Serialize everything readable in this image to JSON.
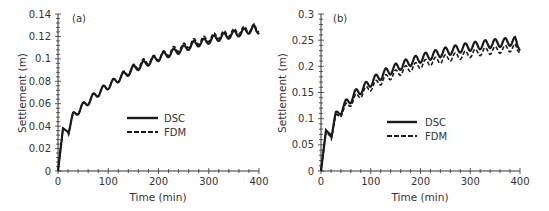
{
  "chart_data": [
    {
      "type": "line",
      "panel_label": "(a)",
      "xlabel": "Time (min)",
      "ylabel": "Settlement (m)",
      "xlim": [
        0,
        400
      ],
      "ylim": [
        0,
        0.14
      ],
      "xticks": [
        "0",
        "100",
        "200",
        "300",
        "400"
      ],
      "yticks": [
        "0",
        "0.02",
        "0.04",
        "0.06",
        "0.08",
        "0.1",
        "0.12",
        "0.14"
      ],
      "grid": false,
      "legend": {
        "position": "center",
        "entries": [
          "DSC",
          "FDM"
        ]
      },
      "oscillation_period_min": 20,
      "series": [
        {
          "name": "DSC",
          "style": "solid",
          "x": [
            0,
            10,
            20,
            30,
            50,
            70,
            90,
            110,
            130,
            150,
            170,
            190,
            210,
            230,
            250,
            270,
            290,
            310,
            330,
            350,
            370,
            390,
            400
          ],
          "y": [
            0,
            0.038,
            0.035,
            0.049,
            0.058,
            0.066,
            0.073,
            0.079,
            0.085,
            0.091,
            0.095,
            0.099,
            0.103,
            0.106,
            0.109,
            0.113,
            0.115,
            0.118,
            0.12,
            0.122,
            0.124,
            0.127,
            0.122
          ],
          "amplitude": 0.003
        },
        {
          "name": "FDM",
          "style": "dashed",
          "x": [
            0,
            10,
            20,
            30,
            50,
            70,
            90,
            110,
            130,
            150,
            170,
            190,
            210,
            230,
            250,
            270,
            290,
            310,
            330,
            350,
            370,
            390,
            400
          ],
          "y": [
            0,
            0.038,
            0.035,
            0.049,
            0.058,
            0.066,
            0.073,
            0.079,
            0.086,
            0.092,
            0.097,
            0.1,
            0.104,
            0.108,
            0.111,
            0.115,
            0.117,
            0.12,
            0.122,
            0.124,
            0.126,
            0.128,
            0.124
          ],
          "amplitude": 0.003
        }
      ]
    },
    {
      "type": "line",
      "panel_label": "(b)",
      "xlabel": "Time (min)",
      "ylabel": "Settlement (m)",
      "xlim": [
        0,
        400
      ],
      "ylim": [
        0,
        0.3
      ],
      "xticks": [
        "0",
        "100",
        "200",
        "300",
        "400"
      ],
      "yticks": [
        "0",
        "0.05",
        "0.1",
        "0.15",
        "0.2",
        "0.25",
        "0.3"
      ],
      "grid": false,
      "legend": {
        "position": "center",
        "entries": [
          "DSC",
          "FDM"
        ]
      },
      "oscillation_period_min": 20,
      "series": [
        {
          "name": "DSC",
          "style": "solid",
          "x": [
            0,
            10,
            20,
            30,
            50,
            70,
            90,
            110,
            130,
            150,
            170,
            190,
            210,
            230,
            250,
            270,
            290,
            310,
            330,
            350,
            370,
            390,
            400
          ],
          "y": [
            0,
            0.078,
            0.068,
            0.105,
            0.128,
            0.148,
            0.162,
            0.176,
            0.188,
            0.197,
            0.205,
            0.212,
            0.218,
            0.223,
            0.228,
            0.232,
            0.236,
            0.239,
            0.242,
            0.244,
            0.246,
            0.248,
            0.23
          ],
          "amplitude": 0.008
        },
        {
          "name": "FDM",
          "style": "dashed",
          "x": [
            0,
            10,
            20,
            30,
            50,
            70,
            90,
            110,
            130,
            150,
            170,
            190,
            210,
            230,
            250,
            270,
            290,
            310,
            330,
            350,
            370,
            390,
            400
          ],
          "y": [
            0,
            0.075,
            0.065,
            0.1,
            0.122,
            0.14,
            0.154,
            0.166,
            0.177,
            0.186,
            0.194,
            0.2,
            0.206,
            0.21,
            0.215,
            0.219,
            0.222,
            0.226,
            0.229,
            0.231,
            0.233,
            0.236,
            0.225
          ],
          "amplitude": 0.007
        }
      ]
    }
  ],
  "panels": [
    {
      "label": "(a)",
      "xlabel": "Time (min)",
      "ylabel": "Settlement (m)",
      "legend": [
        "DSC",
        "FDM"
      ]
    },
    {
      "label": "(b)",
      "xlabel": "Time (min)",
      "ylabel": "Settlement (m)",
      "legend": [
        "DSC",
        "FDM"
      ]
    }
  ]
}
